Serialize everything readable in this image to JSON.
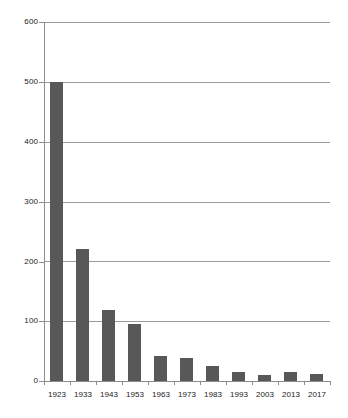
{
  "chart_data": {
    "type": "bar",
    "title": "",
    "subtitle": "",
    "xlabel": "",
    "ylabel": "",
    "categories": [
      "1923",
      "1933",
      "1943",
      "1953",
      "1963",
      "1973",
      "1983",
      "1993",
      "2003",
      "2013",
      "2017"
    ],
    "values": [
      500,
      220,
      118,
      96,
      42,
      38,
      25,
      15,
      10,
      15,
      12
    ],
    "series": [
      {
        "name": "",
        "values": [
          500,
          220,
          118,
          96,
          42,
          38,
          25,
          15,
          10,
          15,
          12
        ]
      }
    ],
    "ylim": [
      0,
      600
    ],
    "yticks": [
      0,
      100,
      200,
      300,
      400,
      500,
      600
    ],
    "ytick_labels": [
      "0",
      "100",
      "200",
      "300",
      "400",
      "500",
      "600"
    ],
    "grid": "horizontal",
    "legend": "none",
    "bar_color": "#585858",
    "grid_color": "#9a9a9a",
    "axis_color": "#8c8c8c",
    "background_color": "#ffffff",
    "text_color": "#1a1a1a",
    "annotations": []
  }
}
